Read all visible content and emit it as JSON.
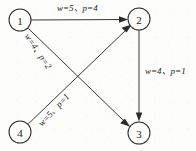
{
  "diagram": {
    "background_color": "#fdfdfc",
    "line_color": "#3a3a3a",
    "text_color": "#1c1c1c",
    "nodes": [
      {
        "id": "1",
        "label": "1",
        "cx": 20,
        "cy": 20,
        "r": 11
      },
      {
        "id": "2",
        "label": "2",
        "cx": 139,
        "cy": 19,
        "r": 11
      },
      {
        "id": "3",
        "label": "3",
        "cx": 139,
        "cy": 133,
        "r": 11
      },
      {
        "id": "4",
        "label": "4",
        "cx": 20,
        "cy": 132,
        "r": 11
      }
    ],
    "edges": [
      {
        "id": "e12",
        "from": "1",
        "to": "2",
        "w": 5,
        "p": 4,
        "label": "w=5、p=4"
      },
      {
        "id": "e13",
        "from": "1",
        "to": "3",
        "w": 4,
        "p": 2,
        "label": "w=4、p=2"
      },
      {
        "id": "e42",
        "from": "4",
        "to": "2",
        "w": 5,
        "p": 1,
        "label": "w=5、p=1"
      },
      {
        "id": "e23",
        "from": "2",
        "to": "3",
        "w": 4,
        "p": 1,
        "label": "w=4、p=1"
      }
    ]
  }
}
